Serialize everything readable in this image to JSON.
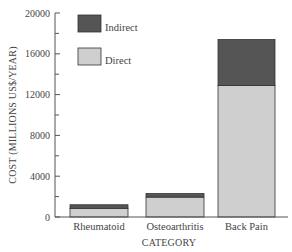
{
  "chart_data": {
    "type": "bar",
    "stacked": true,
    "title": "",
    "xlabel": "CATEGORY",
    "ylabel": "COST (MILLIONS US$/YEAR)",
    "ylim": [
      0,
      20000
    ],
    "yticks": [
      0,
      4000,
      8000,
      12000,
      16000,
      20000
    ],
    "minor_yticks": [
      2000,
      6000,
      10000,
      14000,
      18000
    ],
    "grid": false,
    "legend_position": "upper-left-inside",
    "categories": [
      "Rheumatoid",
      "Osteoarthritis",
      "Back Pain"
    ],
    "series": [
      {
        "name": "Direct",
        "color": "#cfcfcf",
        "values": [
          850,
          1950,
          12900
        ]
      },
      {
        "name": "Indirect",
        "color": "#555555",
        "values": [
          350,
          350,
          4500
        ]
      }
    ],
    "totals": [
      1200,
      2300,
      17400
    ]
  },
  "legend": {
    "items": [
      {
        "label": "Indirect",
        "color": "#555555"
      },
      {
        "label": "Direct",
        "color": "#cfcfcf"
      }
    ]
  }
}
